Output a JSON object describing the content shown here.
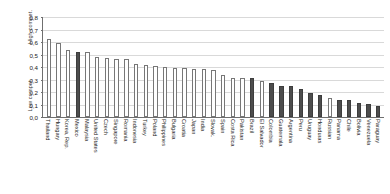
{
  "chart_data": {
    "type": "bar",
    "title": "",
    "xlabel": "",
    "ylabel": "",
    "ylim": [
      0,
      0.8
    ],
    "grid": true,
    "legend": "none",
    "axis_titles": {
      "top": "High compet.",
      "bottom": "Low compet."
    },
    "ytick_labels": [
      "0,8",
      "0,7",
      "0,6",
      "0,5",
      "0,4",
      "0,3",
      "0,2",
      "0,1",
      "0,0"
    ],
    "ytick_values": [
      0.8,
      0.7,
      0.6,
      0.5,
      0.4,
      0.3,
      0.2,
      0.1,
      0.0
    ],
    "categories": [
      "Thailand",
      "Hungary",
      "Korea, Rep.",
      "Mexico",
      "Malaysia",
      "United States",
      "Czech",
      "Singapore",
      "Romania",
      "Indonesia",
      "Turkey",
      "Poland",
      "Philippines",
      "Bulgaria",
      "Croatia",
      "Japan",
      "India",
      "Slovak.",
      "Spain",
      "Costa Rica",
      "Pakistan",
      "Brazil",
      "El Salvador",
      "Colombia",
      "Guatemala",
      "Argentina",
      "Peru",
      "Uruguay",
      "Honduras",
      "Russian",
      "Panama",
      "Chile",
      "Bolivia",
      "Venezuela",
      "Paraguay"
    ],
    "values": [
      0.625,
      0.595,
      0.535,
      0.52,
      0.52,
      0.48,
      0.475,
      0.465,
      0.465,
      0.425,
      0.42,
      0.405,
      0.4,
      0.395,
      0.39,
      0.385,
      0.385,
      0.375,
      0.34,
      0.31,
      0.31,
      0.315,
      0.285,
      0.27,
      0.25,
      0.25,
      0.225,
      0.19,
      0.18,
      0.15,
      0.14,
      0.135,
      0.115,
      0.105,
      0.09
    ],
    "bar_styles": [
      "light",
      "light",
      "light",
      "dark",
      "light",
      "light",
      "light",
      "light",
      "light",
      "light",
      "light",
      "light",
      "light",
      "light",
      "light",
      "light",
      "light",
      "light",
      "light",
      "light",
      "light",
      "dark",
      "light",
      "dark",
      "dark",
      "dark",
      "dark",
      "dark",
      "dark",
      "light",
      "dark",
      "dark",
      "dark",
      "dark",
      "dark"
    ],
    "colors": {
      "bar_light_fill": "#ffffff",
      "bar_light_stroke": "#777777",
      "bar_dark_fill": "#4d4d4d",
      "axis": "#6f6f6f",
      "gridline": "#d9d9d9"
    }
  }
}
